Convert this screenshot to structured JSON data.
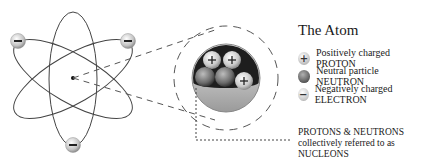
{
  "title": "The Atom",
  "legend": [
    {
      "symbol": "+",
      "type": "proton",
      "label": "Positively charged PROTON"
    },
    {
      "symbol": "",
      "type": "neutron",
      "label": "Neutral particle NEUTRON"
    },
    {
      "symbol": "−",
      "type": "electron",
      "label": "Negatively charged ELECTRON"
    }
  ],
  "note": {
    "line1": "PROTONS & NEUTRONS",
    "line2": "collectively referred to as",
    "line3": "NUCLEONS"
  },
  "electron_symbol": "−",
  "proton_symbol": "+",
  "colors": {
    "orbit": "#444444",
    "dash": "#555555",
    "nucleus_dark": "#1e1e1e",
    "nucleus_light": "#c8c8c8"
  }
}
